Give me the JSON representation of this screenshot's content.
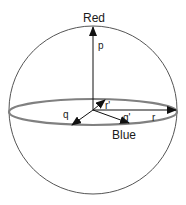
{
  "diagram": {
    "type": "color-sphere",
    "labels": {
      "top_axis": "Red",
      "equator_axis": "Blue",
      "vec_up": "p",
      "vec_left": "q",
      "vec_back": "r'",
      "vec_front_right": "q'",
      "vec_right": "r"
    },
    "colors": {
      "sphere_stroke": "#555555",
      "equator_stroke": "#808080",
      "arrow": "#111111",
      "background": "#ffffff"
    },
    "geometry": {
      "sphere_center": [
        93,
        110
      ],
      "sphere_radius": 84,
      "equator_rx": 84,
      "equator_ry": 13,
      "origin": [
        93,
        110
      ]
    },
    "vectors": [
      {
        "name": "p",
        "from": [
          93,
          110
        ],
        "to": [
          93,
          27
        ]
      },
      {
        "name": "q",
        "from": [
          93,
          110
        ],
        "to": [
          72,
          125
        ]
      },
      {
        "name": "r'",
        "from": [
          93,
          110
        ],
        "to": [
          105,
          100
        ]
      },
      {
        "name": "q'",
        "from": [
          93,
          110
        ],
        "to": [
          129,
          123
        ]
      },
      {
        "name": "r",
        "from": [
          93,
          110
        ],
        "to": [
          176,
          110
        ]
      }
    ]
  }
}
